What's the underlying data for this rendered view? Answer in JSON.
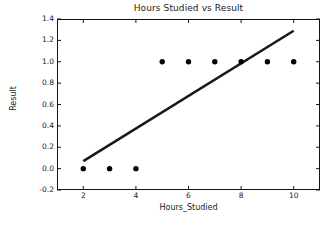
{
  "chart_data": {
    "type": "scatter",
    "title": "Hours Studied vs Result",
    "xlabel": "Hours_Studied",
    "ylabel": "Result",
    "xlim": [
      1.0,
      11.0
    ],
    "ylim": [
      -0.2,
      1.4
    ],
    "xticks": [
      2,
      4,
      6,
      8,
      10
    ],
    "xtick_labels": [
      "2",
      "4",
      "6",
      "8",
      "10"
    ],
    "yticks": [
      -0.2,
      0.0,
      0.2,
      0.4,
      0.6,
      0.8,
      1.0,
      1.2,
      1.4
    ],
    "ytick_labels": [
      "-0.2",
      "0.0",
      "0.2",
      "0.4",
      "0.6",
      "0.8",
      "1.0",
      "1.2",
      "1.4"
    ],
    "grid": false,
    "legend": null,
    "series": [
      {
        "name": "observations",
        "kind": "scatter",
        "marker": "circle",
        "color": "#000000",
        "x": [
          2,
          3,
          4,
          5,
          6,
          7,
          8,
          9,
          10
        ],
        "y": [
          0.0,
          0.0,
          0.0,
          1.0,
          1.0,
          1.0,
          1.0,
          1.0,
          1.0
        ]
      },
      {
        "name": "fitted-line",
        "kind": "line",
        "color": "#1a1a1a",
        "x": [
          2,
          10
        ],
        "y": [
          0.07,
          1.29
        ]
      }
    ]
  },
  "figure": {
    "background_color": "#ffffff",
    "axes_edge_color": "#141414",
    "text_color": "#1a1a1a"
  }
}
